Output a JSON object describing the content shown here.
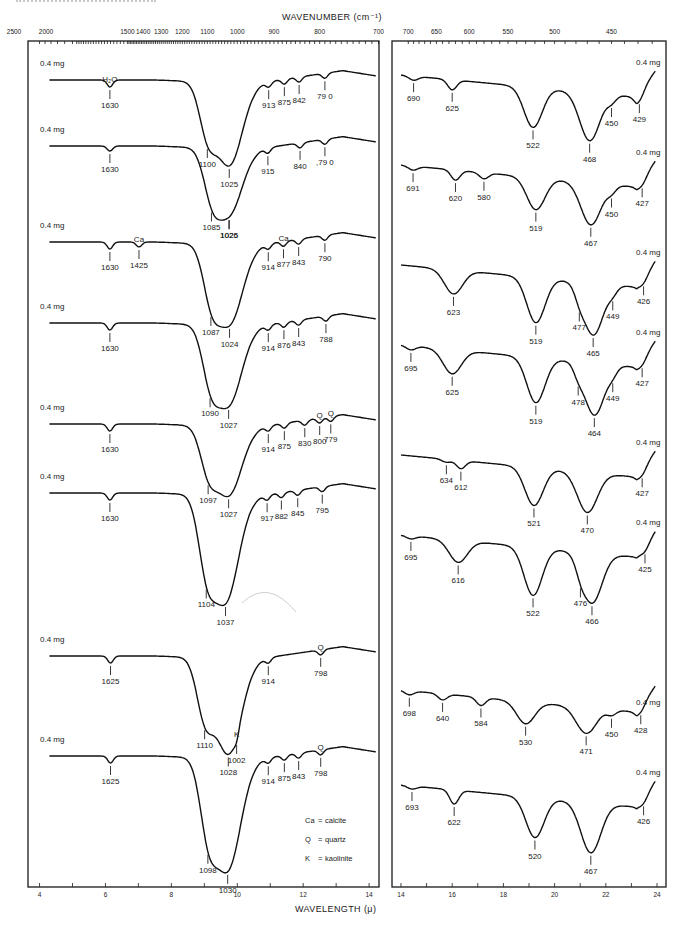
{
  "page_caption": "SPECTRA OF MINERALS",
  "chart_data": [
    {
      "type": "line",
      "title": "",
      "panel": "left",
      "top_axis": {
        "title": "WAVENUMBER (cm⁻¹)",
        "tick_labels": [
          "2500",
          "2000",
          "1500",
          "1400",
          "1300",
          "1200",
          "1100",
          "1000",
          "900",
          "800",
          "700"
        ]
      },
      "bottom_axis": {
        "title": "WAVELENGTH (μ)",
        "range": [
          4,
          14
        ],
        "tick_labels": [
          "4",
          "6",
          "8",
          "10",
          "12",
          "14"
        ]
      },
      "grid": false,
      "legend": {
        "placement": "bottom-right",
        "entries": [
          {
            "symbol": "Ca",
            "meaning": "calcite"
          },
          {
            "symbol": "Q",
            "meaning": "quartz"
          },
          {
            "symbol": "K",
            "meaning": "kaolinite"
          }
        ]
      },
      "series": [
        {
          "name": "spectrum-1",
          "mass": "0.4 mg",
          "peaks": [
            {
              "wn": 1630,
              "label": "1630",
              "note": "H₂O"
            },
            {
              "wn": 1100,
              "label": "1100"
            },
            {
              "wn": 1025,
              "label": "1025"
            },
            {
              "wn": 913,
              "label": "913"
            },
            {
              "wn": 875,
              "label": "875"
            },
            {
              "wn": 842,
              "label": "842"
            },
            {
              "wn": 790,
              "label": "79 0"
            }
          ]
        },
        {
          "name": "spectrum-2",
          "mass": "0.4 mg",
          "peaks": [
            {
              "wn": 1630,
              "label": "1630"
            },
            {
              "wn": 1085,
              "label": "1085"
            },
            {
              "wn": 1026,
              "label": "1026"
            },
            {
              "wn": 1025,
              "label": "1025"
            },
            {
              "wn": 915,
              "label": "915"
            },
            {
              "wn": 840,
              "label": "840"
            },
            {
              "wn": 790,
              "label": ",79 0"
            }
          ]
        },
        {
          "name": "spectrum-3",
          "mass": "0.4 mg",
          "peaks": [
            {
              "wn": 1630,
              "label": "1630"
            },
            {
              "wn": 1425,
              "label": "1425",
              "note": "Ca"
            },
            {
              "wn": 1087,
              "label": "1087"
            },
            {
              "wn": 1024,
              "label": "1024"
            },
            {
              "wn": 914,
              "label": "914"
            },
            {
              "wn": 877,
              "label": "877",
              "note": "Ca"
            },
            {
              "wn": 843,
              "label": "843"
            },
            {
              "wn": 790,
              "label": "790"
            }
          ]
        },
        {
          "name": "spectrum-4",
          "mass": "0.4 mg",
          "peaks": [
            {
              "wn": 1630,
              "label": "1630"
            },
            {
              "wn": 1090,
              "label": "1090"
            },
            {
              "wn": 1027,
              "label": "1027"
            },
            {
              "wn": 914,
              "label": "914"
            },
            {
              "wn": 876,
              "label": "876"
            },
            {
              "wn": 843,
              "label": "843"
            },
            {
              "wn": 788,
              "label": "788"
            }
          ]
        },
        {
          "name": "spectrum-5",
          "mass": "0.4 mg",
          "peaks": [
            {
              "wn": 1630,
              "label": "1630"
            },
            {
              "wn": 1097,
              "label": "1097"
            },
            {
              "wn": 1027,
              "label": "1027"
            },
            {
              "wn": 914,
              "label": "914"
            },
            {
              "wn": 875,
              "label": "875"
            },
            {
              "wn": 830,
              "label": "830"
            },
            {
              "wn": 800,
              "label": "800",
              "note": "Q"
            },
            {
              "wn": 779,
              "label": "779",
              "note": "Q"
            }
          ]
        },
        {
          "name": "spectrum-6",
          "mass": "0.4 mg",
          "peaks": [
            {
              "wn": 1630,
              "label": "1630"
            },
            {
              "wn": 1104,
              "label": "1104"
            },
            {
              "wn": 1037,
              "label": "1037"
            },
            {
              "wn": 917,
              "label": "917"
            },
            {
              "wn": 882,
              "label": "882"
            },
            {
              "wn": 845,
              "label": "845"
            },
            {
              "wn": 795,
              "label": "795"
            }
          ]
        },
        {
          "name": "spectrum-7",
          "mass": "0.4 mg",
          "peaks": [
            {
              "wn": 1625,
              "label": "1625"
            },
            {
              "wn": 1110,
              "label": "1110"
            },
            {
              "wn": 1028,
              "label": "1028"
            },
            {
              "wn": 1002,
              "label": "1002",
              "note": "K"
            },
            {
              "wn": 914,
              "label": "914"
            },
            {
              "wn": 798,
              "label": "798",
              "note": "Q"
            }
          ]
        },
        {
          "name": "spectrum-8",
          "mass": "0.4 mg",
          "peaks": [
            {
              "wn": 1625,
              "label": "1625"
            },
            {
              "wn": 1098,
              "label": "1098"
            },
            {
              "wn": 1030,
              "label": "1030"
            },
            {
              "wn": 914,
              "label": "914"
            },
            {
              "wn": 875,
              "label": "875"
            },
            {
              "wn": 843,
              "label": "843"
            },
            {
              "wn": 798,
              "label": "798",
              "note": "Q"
            }
          ]
        }
      ]
    },
    {
      "type": "line",
      "title": "",
      "panel": "right",
      "top_axis": {
        "title": "",
        "tick_labels": [
          "700",
          "650",
          "600",
          "550",
          "500",
          "450"
        ]
      },
      "bottom_axis": {
        "title": "",
        "range": [
          14,
          24
        ],
        "tick_labels": [
          "14",
          "16",
          "18",
          "20",
          "22",
          "24"
        ]
      },
      "grid": false,
      "series": [
        {
          "name": "spectrum-1",
          "mass": "0.4 mg",
          "peaks": [
            {
              "wn": 690,
              "label": "690"
            },
            {
              "wn": 625,
              "label": "625"
            },
            {
              "wn": 522,
              "label": "522"
            },
            {
              "wn": 468,
              "label": "468"
            },
            {
              "wn": 450,
              "label": "450"
            },
            {
              "wn": 429,
              "label": "429"
            }
          ]
        },
        {
          "name": "spectrum-2",
          "mass": "0.4 mg",
          "peaks": [
            {
              "wn": 691,
              "label": "691"
            },
            {
              "wn": 620,
              "label": "620"
            },
            {
              "wn": 580,
              "label": "580"
            },
            {
              "wn": 519,
              "label": "519"
            },
            {
              "wn": 467,
              "label": "467"
            },
            {
              "wn": 450,
              "label": "450"
            },
            {
              "wn": 427,
              "label": "427"
            }
          ]
        },
        {
          "name": "spectrum-3",
          "mass": "0.4 mg",
          "peaks": [
            {
              "wn": 623,
              "label": "623"
            },
            {
              "wn": 519,
              "label": "519"
            },
            {
              "wn": 477,
              "label": "477"
            },
            {
              "wn": 465,
              "label": "465"
            },
            {
              "wn": 449,
              "label": "449"
            },
            {
              "wn": 426,
              "label": "426"
            }
          ]
        },
        {
          "name": "spectrum-4",
          "mass": "0.4 mg",
          "peaks": [
            {
              "wn": 695,
              "label": "695"
            },
            {
              "wn": 625,
              "label": "625"
            },
            {
              "wn": 519,
              "label": "519"
            },
            {
              "wn": 478,
              "label": "478"
            },
            {
              "wn": 464,
              "label": "464"
            },
            {
              "wn": 449,
              "label": "449"
            },
            {
              "wn": 427,
              "label": "427"
            }
          ]
        },
        {
          "name": "spectrum-5",
          "mass": "0.4 mg",
          "peaks": [
            {
              "wn": 634,
              "label": "634"
            },
            {
              "wn": 612,
              "label": "612"
            },
            {
              "wn": 521,
              "label": "521"
            },
            {
              "wn": 470,
              "label": "470"
            },
            {
              "wn": 427,
              "label": "427"
            }
          ]
        },
        {
          "name": "spectrum-6",
          "mass": "0.4 mg",
          "peaks": [
            {
              "wn": 695,
              "label": "695"
            },
            {
              "wn": 616,
              "label": "616"
            },
            {
              "wn": 522,
              "label": "522"
            },
            {
              "wn": 476,
              "label": "476"
            },
            {
              "wn": 466,
              "label": "466"
            },
            {
              "wn": 425,
              "label": "425"
            }
          ]
        },
        {
          "name": "spectrum-7",
          "mass": "0.4 mg",
          "peaks": [
            {
              "wn": 698,
              "label": "698"
            },
            {
              "wn": 640,
              "label": "640"
            },
            {
              "wn": 584,
              "label": "584"
            },
            {
              "wn": 530,
              "label": "530"
            },
            {
              "wn": 471,
              "label": "471"
            },
            {
              "wn": 450,
              "label": "450"
            },
            {
              "wn": 428,
              "label": "428"
            }
          ]
        },
        {
          "name": "spectrum-8",
          "mass": "0.4 mg",
          "peaks": [
            {
              "wn": 693,
              "label": "693"
            },
            {
              "wn": 622,
              "label": "622"
            },
            {
              "wn": 520,
              "label": "520"
            },
            {
              "wn": 467,
              "label": "467"
            },
            {
              "wn": 426,
              "label": "426"
            }
          ]
        }
      ]
    }
  ]
}
